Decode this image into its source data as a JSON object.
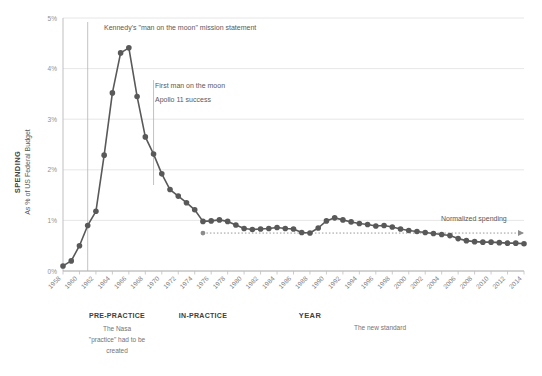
{
  "chart_data": {
    "type": "line",
    "title": "",
    "xlabel": "YEAR",
    "ylabel": "SPENDING",
    "ylabel_sub": "As % of US Federal Budget",
    "ylim": [
      0,
      5
    ],
    "xlim": [
      1958,
      2014
    ],
    "grid": true,
    "legend_position": "none",
    "ytick_labels": [
      "0%",
      "1%",
      "2%",
      "3%",
      "4%",
      "5%"
    ],
    "ytick_values": [
      0,
      1,
      2,
      3,
      4,
      5
    ],
    "xtick_labels": [
      "1958",
      "1960",
      "1962",
      "1964",
      "1966",
      "1968",
      "1970",
      "1972",
      "1974",
      "1976",
      "1978",
      "1980",
      "1982",
      "1984",
      "1986",
      "1988",
      "1990",
      "1992",
      "1994",
      "1996",
      "1998",
      "2000",
      "2002",
      "2004",
      "2006",
      "2008",
      "2010",
      "2012",
      "2014"
    ],
    "series": [
      {
        "name": "NASA spending as % of US federal budget",
        "color": "#595959",
        "x": [
          1958,
          1959,
          1960,
          1961,
          1962,
          1963,
          1964,
          1965,
          1966,
          1967,
          1968,
          1969,
          1970,
          1971,
          1972,
          1973,
          1974,
          1975,
          1976,
          1977,
          1978,
          1979,
          1980,
          1981,
          1982,
          1983,
          1984,
          1985,
          1986,
          1987,
          1988,
          1989,
          1990,
          1991,
          1992,
          1993,
          1994,
          1995,
          1996,
          1997,
          1998,
          1999,
          2000,
          2001,
          2002,
          2003,
          2004,
          2005,
          2006,
          2007,
          2008,
          2009,
          2010,
          2011,
          2012,
          2013,
          2014
        ],
        "values": [
          0.1,
          0.2,
          0.5,
          0.9,
          1.18,
          2.29,
          3.52,
          4.31,
          4.41,
          3.45,
          2.65,
          2.31,
          1.92,
          1.61,
          1.48,
          1.35,
          1.21,
          0.98,
          0.99,
          1.01,
          0.98,
          0.91,
          0.84,
          0.82,
          0.83,
          0.84,
          0.86,
          0.84,
          0.83,
          0.76,
          0.75,
          0.85,
          0.99,
          1.05,
          1.01,
          0.97,
          0.94,
          0.92,
          0.89,
          0.9,
          0.87,
          0.83,
          0.8,
          0.78,
          0.76,
          0.74,
          0.72,
          0.7,
          0.64,
          0.6,
          0.58,
          0.57,
          0.57,
          0.56,
          0.55,
          0.55,
          0.54
        ]
      }
    ],
    "reference_line": {
      "label": "Normalized spending",
      "value": 0.75,
      "x_start": 1975,
      "x_end": 2014,
      "style": "dotted"
    },
    "annotations": [
      {
        "name": "kennedy",
        "text": "Kennedy's \"man on the moon\" mission statement",
        "x_year": 1961,
        "has_vline": true
      },
      {
        "name": "apollo",
        "line1": "First man on the moon",
        "line2": "Apollo 11 success",
        "x_year": 1969,
        "has_vline": true
      }
    ],
    "phase_labels": [
      {
        "title": "PRE-PRACTICE",
        "lines": [
          "The Nasa",
          "\"practice\" had to be",
          "created"
        ]
      },
      {
        "title": "IN-PRACTICE",
        "lines": []
      },
      {
        "title": "",
        "lines": [
          "The new standard"
        ]
      }
    ]
  },
  "colors": {
    "series": "#595959",
    "grid": "#e0e0e0",
    "axis": "#bfbfbf",
    "text": "#595959",
    "text_dark": "#404040"
  }
}
